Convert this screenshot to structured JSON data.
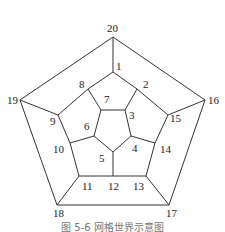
{
  "caption": "图 5-6  网格世界示意图",
  "diagram": {
    "type": "graph",
    "nodes": [
      {
        "id": "1",
        "label": "1",
        "x": 116,
        "y": 70
      },
      {
        "id": "2",
        "label": "2",
        "x": 143,
        "y": 88
      },
      {
        "id": "3",
        "label": "3",
        "x": 129,
        "y": 119
      },
      {
        "id": "4",
        "label": "4",
        "x": 132,
        "y": 152
      },
      {
        "id": "5",
        "label": "5",
        "x": 99,
        "y": 162
      },
      {
        "id": "6",
        "label": "6",
        "x": 84,
        "y": 130
      },
      {
        "id": "7",
        "label": "7",
        "x": 104,
        "y": 103
      },
      {
        "id": "8",
        "label": "8",
        "x": 79,
        "y": 88
      },
      {
        "id": "9",
        "label": "9",
        "x": 50,
        "y": 125
      },
      {
        "id": "10",
        "label": "10",
        "x": 53,
        "y": 153
      },
      {
        "id": "11",
        "label": "11",
        "x": 82,
        "y": 190
      },
      {
        "id": "12",
        "label": "12",
        "x": 108,
        "y": 190
      },
      {
        "id": "13",
        "label": "13",
        "x": 133,
        "y": 190
      },
      {
        "id": "14",
        "label": "14",
        "x": 160,
        "y": 153
      },
      {
        "id": "15",
        "label": "15",
        "x": 170,
        "y": 122
      },
      {
        "id": "16",
        "label": "16",
        "x": 208,
        "y": 104
      },
      {
        "id": "17",
        "label": "17",
        "x": 166,
        "y": 217
      },
      {
        "id": "18",
        "label": "18",
        "x": 53,
        "y": 217
      },
      {
        "id": "19",
        "label": "19",
        "x": 7,
        "y": 104
      },
      {
        "id": "20",
        "label": "20",
        "x": 107,
        "y": 32
      }
    ]
  }
}
